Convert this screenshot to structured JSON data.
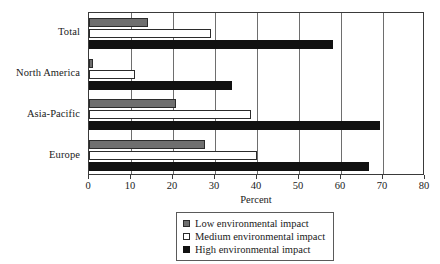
{
  "chart_data": {
    "type": "bar",
    "orientation": "horizontal",
    "title": "",
    "xlabel": "Percent",
    "ylabel": "",
    "xlim": [
      0,
      80
    ],
    "xticks": [
      0,
      10,
      20,
      30,
      40,
      50,
      60,
      70,
      80
    ],
    "grid": true,
    "legend_position": "bottom-center",
    "categories": [
      "Total",
      "North America",
      "Asia-Pacific",
      "Europe"
    ],
    "series": [
      {
        "name": "Low environmental impact",
        "color": "#6f6f6f",
        "values": [
          14,
          1,
          20.7,
          27.6
        ]
      },
      {
        "name": "Medium environmental impact",
        "color": "#ffffff",
        "values": [
          29,
          11,
          38.6,
          40
        ]
      },
      {
        "name": "High environmental impact",
        "color": "#111111",
        "values": [
          58,
          34,
          69.3,
          66.7
        ]
      }
    ]
  },
  "legend": {
    "items": [
      {
        "label": "Low environmental impact",
        "swatch": "low"
      },
      {
        "label": "Medium environmental impact",
        "swatch": "medium"
      },
      {
        "label": "High environmental impact",
        "swatch": "high"
      }
    ]
  }
}
